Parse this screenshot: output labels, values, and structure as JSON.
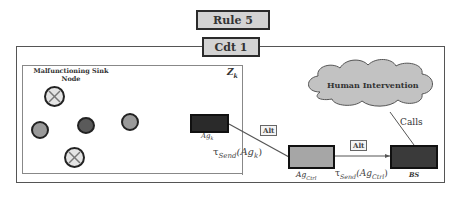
{
  "header": {
    "rule_label": "Rule 5",
    "condition_label": "Cdt 1"
  },
  "zone": {
    "label": "Z",
    "label_sub": "k",
    "title_line1": "Malfunctioning Sink",
    "title_line2": "Node"
  },
  "nodes": [
    {
      "id": "faulty-top",
      "state": "malfunctioning"
    },
    {
      "id": "left",
      "state": "normal"
    },
    {
      "id": "center",
      "state": "dark"
    },
    {
      "id": "right",
      "state": "normal"
    },
    {
      "id": "faulty-bottom",
      "state": "malfunctioning"
    }
  ],
  "agents": {
    "ag_k": {
      "label": "Ag",
      "sub": "k",
      "color": "#2a2a2a"
    },
    "ag_ctrl": {
      "label": "Ag",
      "sub": "Ctrl",
      "color": "#a6a6a6"
    },
    "bs": {
      "label": "BS",
      "color": "#3a3a3a"
    }
  },
  "cloud": {
    "label": "Human Intervention",
    "color": "#c2c2c2"
  },
  "edges": {
    "agk_to_ctrl": {
      "label": "Alt",
      "tau": "τ",
      "tau_sub": "Send",
      "arg": "(Ag",
      "arg_sub": "k",
      "arg_close": ")"
    },
    "ctrl_to_bs": {
      "label": "Alt",
      "tau": "τ",
      "tau_sub": "Send",
      "arg": "(Ag",
      "arg_sub": "Ctrl",
      "arg_close": ")"
    },
    "bs_to_cloud": {
      "label": "Calls"
    }
  }
}
